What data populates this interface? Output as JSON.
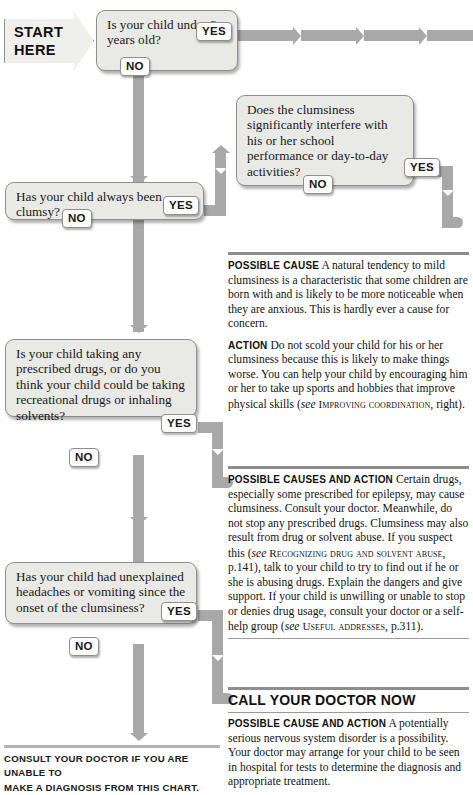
{
  "start": {
    "line1": "START",
    "line2": "HERE"
  },
  "labels": {
    "yes": "YES",
    "no": "NO"
  },
  "questions": [
    {
      "id": "q1",
      "text": "Is your child under 3 years old?"
    },
    {
      "id": "q2",
      "text": "Does the clumsiness significantly interfere with his or her school performance or day-to-day activities?"
    },
    {
      "id": "q3",
      "text": "Has your child always been clumsy?"
    },
    {
      "id": "q4",
      "text": "Is your child taking any prescribed drugs, or do you think your child could be taking recreational drugs or inhaling solvents?"
    },
    {
      "id": "q5",
      "text": "Has your child had unexplained headaches or vomiting since the onset of the clumsiness?"
    }
  ],
  "advice": [
    {
      "id": "advice1",
      "paragraphs": [
        {
          "lead": "Possible cause",
          "body": "A natural tendency to mild clumsiness is a characteristic that some children are born with and is likely to be more noticeable when they are anxious. This is hardly ever a cause for concern."
        },
        {
          "lead": "Action",
          "body": "Do not scold your child for his or her clumsiness because this is likely to make things worse. You can help your child by encouraging him or her to take up sports and hobbies that improve physical skills (see IMPROVING COORDINATION, right).",
          "see": "see",
          "crossref": "Improving coordination",
          "tail": ", right)."
        }
      ]
    },
    {
      "id": "advice2",
      "paragraphs": [
        {
          "lead": "Possible causes and action",
          "body": "Certain drugs, especially some prescribed for epilepsy, may cause clumsiness. Consult your doctor. Meanwhile, do not stop any prescribed drugs. Clumsiness may also result from drug or solvent abuse. If you suspect this (see RECOGNIZING DRUG AND SOLVENT ABUSE, p.141), talk to your child to try to find out if he or she is abusing drugs. Explain the dangers and give support. If your child is unwilling or unable to stop or denies drug usage, consult your doctor or a self-help group (see USEFUL ADDRESSES, p.311)."
        }
      ]
    },
    {
      "id": "advice3",
      "heading": "CALL YOUR DOCTOR NOW",
      "paragraphs": [
        {
          "lead": "Possible cause and action",
          "body": "A potentially serious nervous system disorder is a possibility. Your doctor may arrange for your child to be seen in hospital for tests to determine the diagnosis and appropriate treatment."
        }
      ]
    }
  ],
  "advice1_p1_lead": "Possible cause",
  "advice1_p1_body": "A natural tendency to mild clumsiness is a characteristic that some children are born with and is likely to be more noticeable when they are anxious. This is hardly ever a cause for concern.",
  "advice1_p2_lead": "Action",
  "advice1_p2_body_pre": "Do not scold your child for his or her clumsiness because this is likely to make things worse. You can help your child by encouraging him or her to take up sports and hobbies that improve physical skills (",
  "advice1_p2_see": "see",
  "advice1_p2_xref": "Improving coordination",
  "advice1_p2_tail": ", right).",
  "advice2_lead": "Possible causes and action",
  "advice2_body_a": "Certain drugs, especially some prescribed for epilepsy, may cause clumsiness. Consult your doctor. Meanwhile, do not stop any prescribed drugs. Clumsiness may also result from drug or solvent abuse. If you suspect this (",
  "advice2_see1": "see",
  "advice2_xref1": "Recognizing drug and solvent abuse",
  "advice2_body_b": ", p.141), talk to your child to try to find out if he or she is abusing drugs. Explain the dangers and give support. If your child is unwilling or unable to stop or denies drug usage, consult your doctor or a self-help group (",
  "advice2_see2": "see",
  "advice2_xref2": "Useful addresses",
  "advice2_body_c": ", p.311).",
  "advice3_heading": "CALL YOUR DOCTOR NOW",
  "advice3_lead": "Possible cause and action",
  "advice3_body": "A potentially serious nervous system disorder is a possibility. Your doctor may arrange for your child to be seen in hospital for tests to determine the diagnosis and appropriate treatment.",
  "footer": {
    "line1": "Consult your doctor if you are unable to",
    "line2": "make a diagnosis from this chart."
  },
  "colors": {
    "connector": "#a8a8a8",
    "box_fill": "#e9e9e6",
    "box_border": "#8e8e8c",
    "rule": "#8d8d8d",
    "footer_rule": "#b2b2b2",
    "text": "#141414"
  }
}
